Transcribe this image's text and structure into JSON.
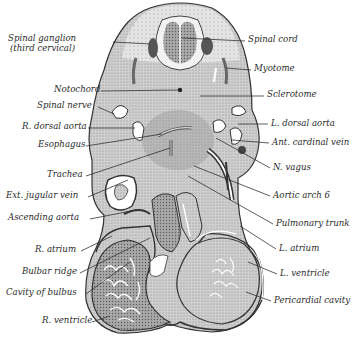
{
  "figure": {
    "colors": {
      "ink": "#2b2b2b",
      "tissue_light": "#c9c9c9",
      "tissue_mid": "#9a9a9a",
      "tissue_dark": "#5e5e5e",
      "cavity": "#ffffff",
      "background": "#ffffff"
    }
  },
  "labels_left": [
    {
      "id": "spinal-ganglion",
      "text": "Spinal ganglion",
      "x": 8,
      "y": 37
    },
    {
      "id": "spinal-ganglion-sub",
      "text": "(third cervical)",
      "x": 10,
      "y": 47
    },
    {
      "id": "notochord",
      "text": "Notochord",
      "x": 54,
      "y": 87
    },
    {
      "id": "spinal-nerve",
      "text": "Spinal nerve",
      "x": 37,
      "y": 103
    },
    {
      "id": "r-dorsal-aorta",
      "text": "R. dorsal aorta",
      "x": 22,
      "y": 124
    },
    {
      "id": "esophagus",
      "text": "Esophagus",
      "x": 38,
      "y": 142
    },
    {
      "id": "trachea",
      "text": "Trachea",
      "x": 47,
      "y": 172
    },
    {
      "id": "ext-jugular-vein",
      "text": "Ext. jugular vein",
      "x": 6,
      "y": 193
    },
    {
      "id": "ascending-aorta",
      "text": "Ascending aorta",
      "x": 8,
      "y": 215
    },
    {
      "id": "r-atrium",
      "text": "R. atrium",
      "x": 35,
      "y": 247
    },
    {
      "id": "bulbar-ridge",
      "text": "Bulbar ridge",
      "x": 22,
      "y": 269
    },
    {
      "id": "cavity-of-bulbus",
      "text": "Cavity of bulbus",
      "x": 6,
      "y": 290
    },
    {
      "id": "r-ventricle",
      "text": "R. ventricle",
      "x": 42,
      "y": 318
    }
  ],
  "labels_right": [
    {
      "id": "spinal-cord",
      "text": "Spinal cord",
      "x": 248,
      "y": 37
    },
    {
      "id": "myotome",
      "text": "Myotome",
      "x": 254,
      "y": 66
    },
    {
      "id": "sclerotome",
      "text": "Sclerotome",
      "x": 267,
      "y": 92
    },
    {
      "id": "l-dorsal-aorta",
      "text": "L. dorsal aorta",
      "x": 271,
      "y": 120
    },
    {
      "id": "ant-cardinal-vein",
      "text": "Ant. cardinal vein",
      "x": 272,
      "y": 139
    },
    {
      "id": "n-vagus",
      "text": "N. vagus",
      "x": 273,
      "y": 165
    },
    {
      "id": "aortic-arch-6",
      "text": "Aortic arch 6",
      "x": 273,
      "y": 193
    },
    {
      "id": "pulmonary-trunk",
      "text": "Pulmonary trunk",
      "x": 276,
      "y": 221
    },
    {
      "id": "l-atrium",
      "text": "L. atrium",
      "x": 279,
      "y": 246
    },
    {
      "id": "l-ventricle",
      "text": "L. ventricle",
      "x": 280,
      "y": 271
    },
    {
      "id": "pericardial-cavity",
      "text": "Pericardial cavity",
      "x": 274,
      "y": 298
    }
  ]
}
